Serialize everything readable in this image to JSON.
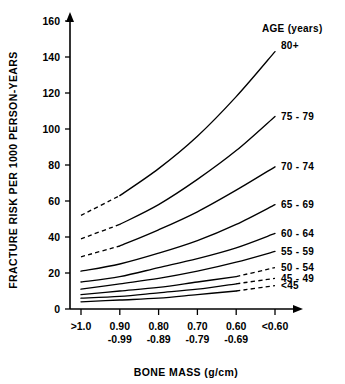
{
  "chart_data": {
    "type": "line",
    "title": "",
    "xlabel": "BONE MASS (g/cm)",
    "ylabel": "FRACTURE RISK PER 1000 PERSON-YEARS",
    "legend_title": "AGE (years)",
    "legend_position": "right",
    "grid": false,
    "ylim": [
      0,
      160
    ],
    "yticks": [
      0,
      20,
      40,
      60,
      80,
      100,
      120,
      140,
      160
    ],
    "ytick_labels": [
      "0",
      "20",
      "40",
      "60",
      "80",
      "100",
      "120",
      "140",
      "160"
    ],
    "categories": [
      ">1.0",
      "0.90 -0.99",
      "0.80 -0.89",
      "0.70 -0.79",
      "0.60 -0.69",
      "<0.60"
    ],
    "xtick_labels_top": [
      ">1.0",
      "0.90",
      "0.80",
      "0.70",
      "0.60",
      "<0.60"
    ],
    "xtick_labels_bottom": [
      "",
      "-0.99",
      "-0.89",
      "-0.79",
      "-0.69",
      ""
    ],
    "series": [
      {
        "name": "80+",
        "label": "80+",
        "values": [
          52,
          63,
          78,
          96,
          118,
          143
        ],
        "dashed_segment": "left",
        "dashed_points": 2
      },
      {
        "name": "75 - 79",
        "label": "75 - 79",
        "values": [
          39,
          47,
          58,
          72,
          88,
          107
        ],
        "dashed_segment": "left",
        "dashed_points": 2
      },
      {
        "name": "70 - 74",
        "label": "70 - 74",
        "values": [
          29,
          35,
          44,
          54,
          66,
          79
        ],
        "dashed_segment": "left",
        "dashed_points": 2
      },
      {
        "name": "65 - 69",
        "label": "65 - 69",
        "values": [
          21,
          25,
          31,
          38,
          47,
          58
        ],
        "dashed_segment": "none",
        "dashed_points": 0
      },
      {
        "name": "60 - 64",
        "label": "60 - 64",
        "values": [
          15,
          18,
          23,
          28,
          34,
          42
        ],
        "dashed_segment": "none",
        "dashed_points": 0
      },
      {
        "name": "55 - 59",
        "label": "55 - 59",
        "values": [
          11,
          14,
          17,
          21,
          26,
          32
        ],
        "dashed_segment": "none",
        "dashed_points": 0
      },
      {
        "name": "50 - 54",
        "label": "50 - 54",
        "values": [
          8,
          10,
          12,
          15,
          18,
          23
        ],
        "dashed_segment": "right",
        "dashed_points": 2
      },
      {
        "name": "45 - 49",
        "label": "45 - 49",
        "values": [
          6,
          7,
          9,
          11,
          14,
          17
        ],
        "dashed_segment": "right",
        "dashed_points": 2
      },
      {
        "name": "<45",
        "label": "<45",
        "values": [
          4,
          5,
          6,
          8,
          10,
          13
        ],
        "dashed_segment": "right",
        "dashed_points": 2
      }
    ]
  },
  "axis": {
    "y_title": "FRACTURE RISK PER 1000 PERSON-YEARS",
    "x_title": "BONE MASS (g/cm)"
  },
  "legend": {
    "title": "AGE (years)"
  }
}
